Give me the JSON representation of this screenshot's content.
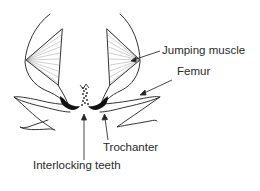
{
  "diagram": {
    "labels": {
      "jumping_muscle": "Jumping muscle",
      "femur": "Femur",
      "trochanter": "Trochanter",
      "interlocking_teeth": "Interlocking teeth"
    },
    "colors": {
      "ink": "#2a2a2a",
      "background": "#ffffff"
    }
  }
}
